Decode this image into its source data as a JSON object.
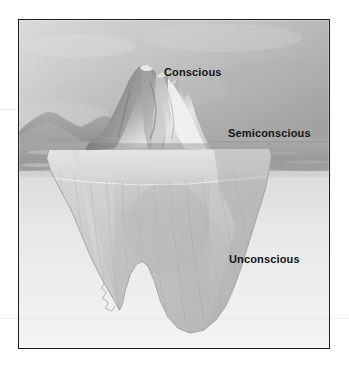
{
  "page": {
    "background_color": "#ffffff",
    "width": 349,
    "height": 372
  },
  "figure": {
    "type": "photograph-diagram",
    "color_mode": "grayscale",
    "frame": {
      "border_color": "#1c1c1c",
      "x": 18,
      "y": 19,
      "width": 312,
      "height": 330
    }
  },
  "scene": {
    "sky": {
      "name": "overcast-grey-sky",
      "top_color": "#c9c9c9",
      "bottom_color": "#a0a0a0"
    },
    "distant_mountains": {
      "name": "distant-mountain-range",
      "color": "#9a9a9a"
    },
    "water": {
      "name": "ocean-surface",
      "color": "#9d9d9d",
      "horizon_y": 128,
      "waterline_y": 150
    },
    "underwater": {
      "name": "underwater-haze",
      "top_color": "#e2e2e2",
      "bottom_color": "#f2f2f2"
    },
    "iceberg_above": {
      "name": "iceberg-tip",
      "light_color": "#f0f0f0",
      "mid_color": "#b4b4b4",
      "shadow_color": "#6f6f6f"
    },
    "iceberg_below": {
      "name": "iceberg-submerged-mass",
      "light_color": "#d8d8d8",
      "mid_color": "#c3c3c3",
      "shadow_color": "#b0b0b0"
    }
  },
  "labels": {
    "conscious": "Conscious",
    "semiconscious": "Semiconscious",
    "unconscious": "Unconscious"
  }
}
